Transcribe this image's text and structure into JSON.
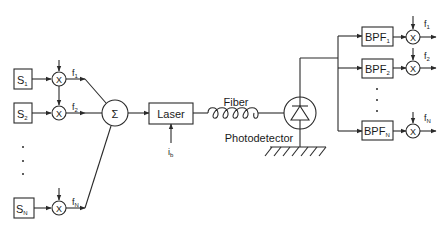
{
  "diagram": {
    "sources": [
      {
        "label": "S",
        "sub": "1"
      },
      {
        "label": "S",
        "sub": "2"
      },
      {
        "label": "S",
        "sub": "N"
      }
    ],
    "mixer_symbol": "X",
    "tx_freqs": [
      {
        "label": "f",
        "sub": "1"
      },
      {
        "label": "f",
        "sub": "2"
      },
      {
        "label": "f",
        "sub": "N"
      }
    ],
    "summer_symbol": "Σ",
    "laser_label": "Laser",
    "bias_label": {
      "label": "i",
      "sub": "b"
    },
    "fiber_label": "Fiber",
    "photodetector_label": "Photodetector",
    "filters": [
      {
        "label": "BPF",
        "sub": "1"
      },
      {
        "label": "BPF",
        "sub": "2"
      },
      {
        "label": "BPF",
        "sub": "N"
      }
    ],
    "rx_freqs": [
      {
        "label": "f",
        "sub": "1"
      },
      {
        "label": "f",
        "sub": "2"
      },
      {
        "label": "f",
        "sub": "N"
      }
    ],
    "ellipsis": "⋮"
  }
}
